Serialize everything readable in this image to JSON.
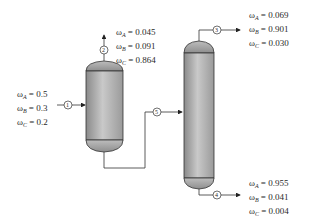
{
  "diagram": {
    "title": "",
    "vessels": [
      {
        "id": "column-1",
        "name": "first column"
      },
      {
        "id": "column-2",
        "name": "second column"
      }
    ],
    "streams": [
      {
        "number": "1",
        "label": "feed",
        "compositions": [
          {
            "symbol": "ω",
            "sub": "A",
            "value": "0.5"
          },
          {
            "symbol": "ω",
            "sub": "B",
            "value": "0.3"
          },
          {
            "symbol": "ω",
            "sub": "C",
            "value": "0.2"
          }
        ]
      },
      {
        "number": "2",
        "label": "column-1 overhead",
        "compositions": [
          {
            "symbol": "ω",
            "sub": "A",
            "value": "0.045"
          },
          {
            "symbol": "ω",
            "sub": "B",
            "value": "0.091"
          },
          {
            "symbol": "ω",
            "sub": "C",
            "value": "0.864"
          }
        ]
      },
      {
        "number": "3",
        "label": "column-2 overhead",
        "compositions": [
          {
            "symbol": "ω",
            "sub": "A",
            "value": "0.069"
          },
          {
            "symbol": "ω",
            "sub": "B",
            "value": "0.901"
          },
          {
            "symbol": "ω",
            "sub": "C",
            "value": "0.030"
          }
        ]
      },
      {
        "number": "4",
        "label": "column-2 bottoms",
        "compositions": [
          {
            "symbol": "ω",
            "sub": "A",
            "value": "0.955"
          },
          {
            "symbol": "ω",
            "sub": "B",
            "value": "0.041"
          },
          {
            "symbol": "ω",
            "sub": "C",
            "value": "0.004"
          }
        ]
      },
      {
        "number": "5",
        "label": "intermediate stream",
        "compositions": []
      }
    ],
    "colors": {
      "line": "#333333",
      "vessel_dark": "#7a7a7a",
      "vessel_light": "#d8d8d8"
    }
  }
}
